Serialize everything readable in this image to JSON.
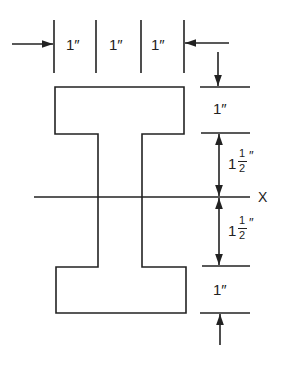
{
  "diagram": {
    "title": "",
    "shape": "I-beam cross-section",
    "stroke_color": "#222222",
    "background": "#ffffff",
    "horizontal_dimensions": [
      {
        "label": "1″"
      },
      {
        "label": "1″"
      },
      {
        "label": "1″"
      }
    ],
    "vertical_dimensions": [
      {
        "label": "1″",
        "whole": "1",
        "num": "",
        "den": ""
      },
      {
        "label": "1 1/2″",
        "whole": "1",
        "num": "1",
        "den": "2"
      },
      {
        "label": "1 1/2″",
        "whole": "1",
        "num": "1",
        "den": "2"
      },
      {
        "label": "1″",
        "whole": "1",
        "num": "",
        "den": ""
      }
    ],
    "axis_label": "X",
    "inch_mark": "″"
  }
}
